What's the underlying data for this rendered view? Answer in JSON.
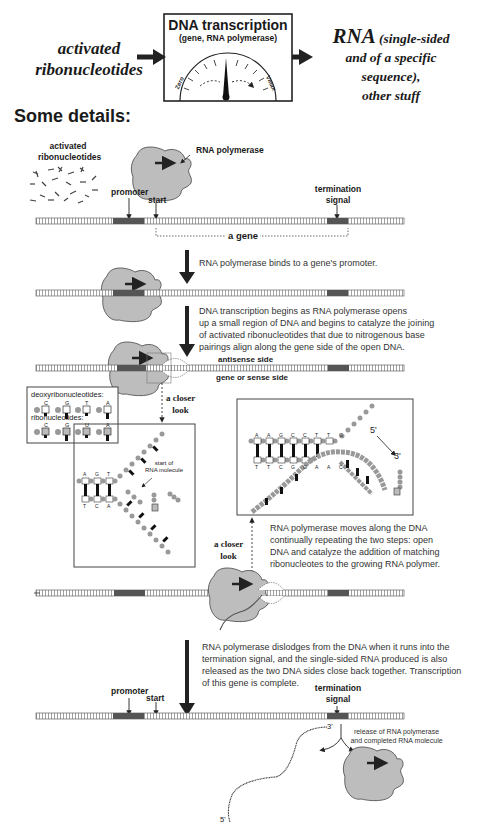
{
  "header": {
    "input_label_line1": "activated",
    "input_label_line2": "ribonucleotides",
    "process_box": {
      "title": "DNA transcription",
      "subtitle": "(gene, RNA polymerase)",
      "gauge": {
        "min_label": "Zero",
        "max_label": "Vmax"
      }
    },
    "output_label": {
      "main": "RNA",
      "line1_rest": "(single-sided",
      "line2": "and of a specific",
      "line3": "sequence),",
      "line4": "other stuff"
    }
  },
  "section_title": "Some details:",
  "stage1": {
    "nucleotides_label_line1": "activated",
    "nucleotides_label_line2": "ribonucleotides",
    "polymerase_label": "RNA polymerase",
    "promoter_label": "promoter",
    "start_label": "start",
    "termination_label_line1": "termination",
    "termination_label_line2": "signal",
    "gene_label": "a gene",
    "strand_end_left": "5' 3'",
    "strand_end_right": "3' 5'"
  },
  "step1": {
    "text": "RNA polymerase binds to a gene's promoter."
  },
  "step2": {
    "lines": [
      "DNA transcription begins as RNA polymerase opens",
      "up a small region of DNA and begins to catalyze the joining",
      "of activated ribonucleotides that due to nitrogenous base",
      "pairings align along the gene side of the open DNA."
    ],
    "antisense_label": "antisense side",
    "sense_label": "gene or sense side"
  },
  "closer_look_1": {
    "label_line1": "a closer",
    "label_line2": "look",
    "legend": {
      "deoxy_title": "deoxyribonucleotides:",
      "deoxy_bases": [
        "C",
        "G",
        "T",
        "A"
      ],
      "ribo_title": "ribonucleotides:",
      "ribo_bases": [
        "C",
        "G",
        "U",
        "A"
      ]
    },
    "top_strand_bases": [
      "A",
      "G",
      "T"
    ],
    "bottom_strand_bases": [
      "T",
      "C",
      "A"
    ],
    "annotation_line1": "start of",
    "annotation_line2": "RNA molecule"
  },
  "closer_look_2": {
    "label_line1": "a closer",
    "label_line2": "look",
    "top_strand_bases": [
      "A",
      "A",
      "G",
      "C",
      "C",
      "T",
      "T",
      "G"
    ],
    "bottom_strand_bases": [
      "T",
      "T",
      "C",
      "G",
      "G",
      "A",
      "A",
      "C"
    ],
    "five_prime": "5'",
    "three_prime": "3'"
  },
  "step3": {
    "lines": [
      "RNA polymerase moves along the DNA",
      "continually repeating the two steps: open",
      "DNA and catalyze the addition of matching",
      "ribonucleotes to the growing RNA polymer."
    ]
  },
  "step4": {
    "lines": [
      "RNA polymerase dislodges from the DNA when it runs into the",
      "termination signal, and the single-sided RNA produced is also",
      "released as the two DNA sides close back together. Transcription",
      "of this gene is complete."
    ]
  },
  "final_stage": {
    "promoter_label": "promoter",
    "start_label": "start",
    "termination_label_line1": "termination",
    "termination_label_line2": "signal",
    "release_line1": "release of RNA polymerase",
    "release_line2": "and completed RNA molecule",
    "rna_3prime": "3'",
    "rna_5prime": "5'"
  },
  "colors": {
    "polymerase_fill": "#bdbdbd",
    "polymerase_stroke": "#444444",
    "dna_marked_region": "#555555",
    "arrow": "#222222"
  }
}
